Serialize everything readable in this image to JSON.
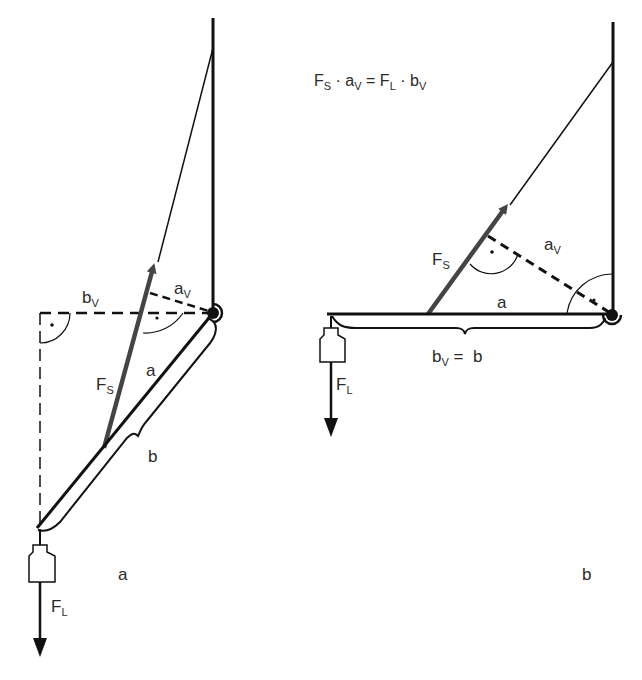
{
  "formula": {
    "F": "F",
    "S": "S",
    "dot": "·",
    "a": "a",
    "V": "V",
    "eq": "=",
    "L": "L",
    "b": "b",
    "text": "F_S · a_V = F_L · b_V"
  },
  "panel_a": {
    "caption": "a",
    "labels": {
      "b_v": "b",
      "b_v_sub": "V",
      "a_v": "a",
      "a_v_sub": "V",
      "fs": "F",
      "fs_sub": "S",
      "a": "a",
      "b": "b",
      "fl": "F",
      "fl_sub": "L"
    }
  },
  "panel_b": {
    "caption": "b",
    "labels": {
      "fs": "F",
      "fs_sub": "S",
      "a_v": "a",
      "a_v_sub": "V",
      "a": "a",
      "bv_eq_b": "b",
      "bv_sub": "V",
      "bv_rest": " =  b",
      "fl": "F",
      "fl_sub": "L"
    }
  },
  "colors": {
    "line": "#111111",
    "arrow": "#444444",
    "text": "#2a2a2a"
  }
}
